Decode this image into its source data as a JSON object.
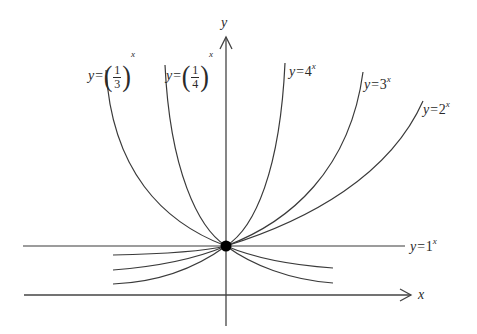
{
  "figure": {
    "axes": {
      "x_label": "x",
      "y_label": "y"
    },
    "common_point": {
      "x": 0,
      "y": 1
    },
    "curves": [
      {
        "id": "four",
        "label_prefix": "y=",
        "base": "4",
        "exponent": "x"
      },
      {
        "id": "three",
        "label_prefix": "y=",
        "base": "3",
        "exponent": "x"
      },
      {
        "id": "two",
        "label_prefix": "y=",
        "base": "2",
        "exponent": "x"
      },
      {
        "id": "one",
        "label_prefix": "y=",
        "base": "1",
        "exponent": "x"
      },
      {
        "id": "third",
        "label_prefix": "y=",
        "base_num": "1",
        "base_den": "3",
        "exponent": "x"
      },
      {
        "id": "quarter",
        "label_prefix": "y=",
        "base_num": "1",
        "base_den": "4",
        "exponent": "x"
      }
    ],
    "colors": {
      "stroke": "#3a3a3a",
      "point": "#000000",
      "background": "#ffffff"
    }
  }
}
